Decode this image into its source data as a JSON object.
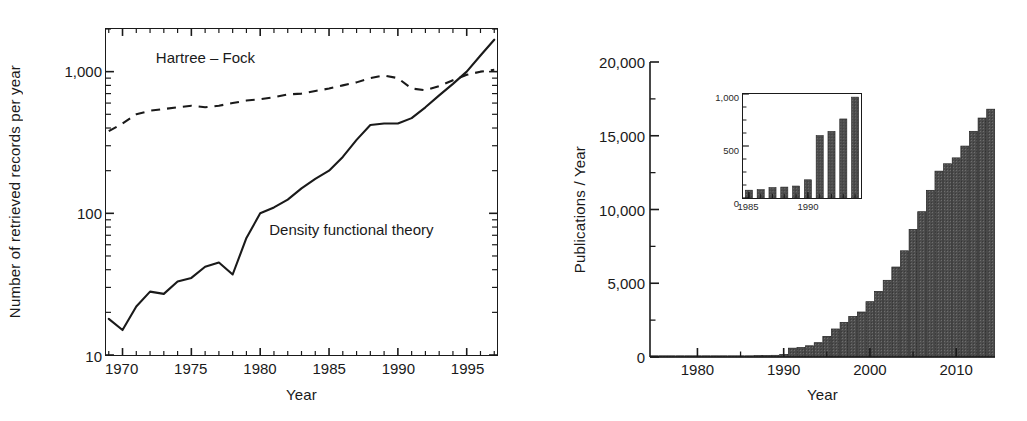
{
  "figure": {
    "panels": [
      "left-line-chart",
      "right-bar-chart"
    ]
  },
  "chart_data": [
    {
      "id": "left",
      "type": "line",
      "title": "",
      "xlabel": "Year",
      "ylabel": "Number of retrieved records per year",
      "xlim": [
        1968.8,
        1997.2
      ],
      "ylim": [
        10,
        2000
      ],
      "yscale": "log",
      "xticks": [
        1970,
        1975,
        1980,
        1985,
        1990,
        1995
      ],
      "xticklabels": [
        "1970",
        "1975",
        "1980",
        "1985",
        "1990",
        "1995"
      ],
      "yticks": [
        10,
        100,
        1000
      ],
      "yticklabels": [
        "10",
        "100",
        "1,000"
      ],
      "grid": false,
      "legend": "inline-annotation",
      "annotations": [
        {
          "text": "Hartree – Fock",
          "x": 1972.4,
          "y": 1250
        },
        {
          "text": "Density functional theory",
          "x": 1980.6,
          "y": 78
        }
      ],
      "series": [
        {
          "name": "Hartree – Fock",
          "style": "dashed",
          "x": [
            1969,
            1970,
            1971,
            1972,
            1973,
            1974,
            1975,
            1976,
            1977,
            1978,
            1979,
            1980,
            1981,
            1982,
            1983,
            1984,
            1985,
            1986,
            1987,
            1988,
            1989,
            1990,
            1991,
            1992,
            1993,
            1994,
            1995,
            1996,
            1997
          ],
          "values": [
            380,
            430,
            500,
            530,
            545,
            560,
            575,
            560,
            575,
            600,
            625,
            640,
            660,
            690,
            700,
            730,
            760,
            800,
            840,
            900,
            940,
            900,
            760,
            740,
            790,
            870,
            950,
            1000,
            1030
          ]
        },
        {
          "name": "Density functional theory",
          "style": "solid",
          "x": [
            1969,
            1970,
            1971,
            1972,
            1973,
            1974,
            1975,
            1976,
            1977,
            1978,
            1979,
            1980,
            1981,
            1982,
            1983,
            1984,
            1985,
            1986,
            1987,
            1988,
            1989,
            1990,
            1991,
            1992,
            1993,
            1994,
            1995,
            1996,
            1997
          ],
          "values": [
            18,
            15,
            22,
            28,
            27,
            33,
            35,
            42,
            45,
            37,
            67,
            100,
            110,
            125,
            150,
            175,
            200,
            250,
            330,
            420,
            430,
            430,
            470,
            560,
            680,
            820,
            1000,
            1300,
            1680
          ]
        }
      ]
    },
    {
      "id": "right",
      "type": "bar",
      "title": "",
      "xlabel": "Year",
      "ylabel": "Publications / Year",
      "xlim": [
        1974.5,
        2014.5
      ],
      "ylim": [
        0,
        20000
      ],
      "xticks": [
        1980,
        1990,
        2000,
        2010
      ],
      "xticklabels": [
        "1980",
        "1990",
        "2000",
        "2010"
      ],
      "yticks": [
        0,
        5000,
        10000,
        15000,
        20000
      ],
      "yticklabels": [
        "0",
        "5,000",
        "10,000",
        "15,000",
        "20,000"
      ],
      "grid": false,
      "bar_color": "#4d4d4d",
      "categories": [
        1975,
        1976,
        1977,
        1978,
        1979,
        1980,
        1981,
        1982,
        1983,
        1984,
        1985,
        1986,
        1987,
        1988,
        1989,
        1990,
        1991,
        1992,
        1993,
        1994,
        1995,
        1996,
        1997,
        1998,
        1999,
        2000,
        2001,
        2002,
        2003,
        2004,
        2005,
        2006,
        2007,
        2008,
        2009,
        2010,
        2011,
        2012,
        2013,
        2014
      ],
      "values": [
        5,
        5,
        5,
        5,
        10,
        10,
        15,
        20,
        25,
        30,
        75,
        80,
        100,
        105,
        115,
        175,
        600,
        640,
        760,
        970,
        1400,
        1900,
        2350,
        2750,
        3050,
        3750,
        4450,
        5200,
        6100,
        7200,
        8650,
        9850,
        11300,
        12600,
        13100,
        13500,
        14300,
        15300,
        16200,
        16800
      ]
    },
    {
      "id": "right-inset",
      "type": "bar",
      "title": "",
      "xlabel": "",
      "ylabel": "",
      "xlim": [
        1984.5,
        1994.5
      ],
      "ylim": [
        0,
        1000
      ],
      "xticks": [
        1985,
        1990
      ],
      "xticklabels": [
        "1985",
        "1990"
      ],
      "yticks": [
        0,
        500,
        1000
      ],
      "yticklabels": [
        "0",
        "500",
        "1,000"
      ],
      "grid": false,
      "bar_color": "#4d4d4d",
      "categories": [
        1985,
        1986,
        1987,
        1988,
        1989,
        1990,
        1991,
        1992,
        1993,
        1994
      ],
      "values": [
        75,
        80,
        100,
        105,
        115,
        175,
        600,
        640,
        760,
        970
      ]
    }
  ]
}
